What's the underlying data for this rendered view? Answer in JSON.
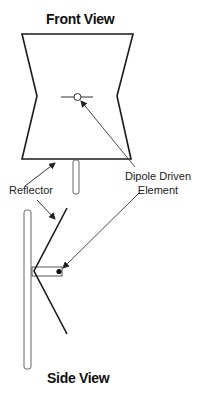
{
  "diagram": {
    "front_view": {
      "title": "Front View"
    },
    "side_view": {
      "title": "Side View"
    },
    "labels": {
      "reflector": "Reflector",
      "dipole_line1": "Dipole Driven",
      "dipole_line2": "Element"
    },
    "colors": {
      "stroke": "#1a1a1a",
      "arrow": "#333333",
      "pole": "#555555",
      "background": "#ffffff"
    }
  }
}
